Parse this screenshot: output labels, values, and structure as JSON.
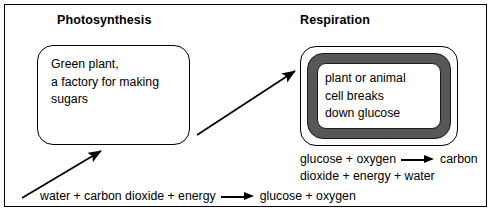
{
  "diagram": {
    "title_left": "Photosynthesis",
    "title_right": "Respiration",
    "photosynthesis_box": {
      "line1": "Green plant,",
      "line2": "a factory for making",
      "line3": "sugars"
    },
    "respiration_box": {
      "line1": "plant or animal",
      "line2": "cell breaks",
      "line3": "down glucose"
    },
    "equations": {
      "respiration": {
        "reactants": "glucose + oxygen",
        "arrow": "arrow-right",
        "products_line1": "carbon",
        "products_line2": "dioxide + energy + water"
      },
      "photosynthesis": {
        "reactants": "water + carbon dioxide + energy",
        "arrow": "arrow-right",
        "products": "glucose + oxygen"
      }
    },
    "arrows": {
      "photosynthesis_input_arrow": "diagonal-arrow-up-right",
      "glucose_transfer_arrow": "diagonal-arrow-up-right"
    },
    "colors": {
      "membrane": "#575757",
      "outline": "#000000",
      "background": "#ffffff"
    }
  }
}
